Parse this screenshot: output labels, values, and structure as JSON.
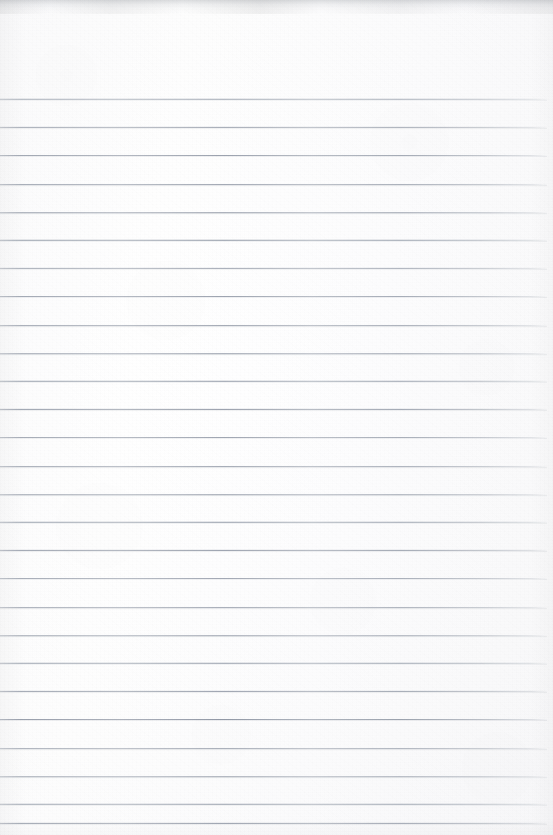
{
  "document": {
    "kind": "scanned-ruled-notebook-page",
    "title": "Blank lined notebook page",
    "page_width": 553,
    "page_height": 835,
    "has_text_content": false,
    "handwriting_present": false,
    "printed_text_present": false,
    "paper_color": "#fdfdfd",
    "paper_tone_note": "near-white, faint warm-grey scan mottling"
  },
  "ruling": {
    "style": "horizontal ruled lines",
    "line_color": "#8b93a0",
    "line_thickness_px": 1,
    "line_spacing_px": 28.2,
    "first_line_y": 99,
    "last_line_y": 823,
    "line_count": 26,
    "line_start_x": 0,
    "line_end_x": 547,
    "right_margin_px": 6,
    "top_margin_px": 99,
    "vertical_margin_rule": false,
    "header_area": "blank unruled band above first line",
    "line_y_positions": [
      99,
      127.2,
      155.4,
      183.6,
      211.8,
      240,
      268.2,
      296.4,
      324.6,
      352.8,
      381,
      409.2,
      437.4,
      465.6,
      493.8,
      522,
      550.2,
      578.4,
      606.6,
      634.8,
      663,
      691.2,
      719.4,
      747.6,
      775.8,
      804
    ],
    "extra_bottom_line_y": 823
  },
  "scan_artifacts": {
    "top_edge_shadow": true,
    "top_edge_shadow_height_px": 14,
    "top_edge_shadow_color": "#8c9198",
    "edge_vignette": true,
    "paper_fibre_noise": true,
    "mottling": true
  }
}
